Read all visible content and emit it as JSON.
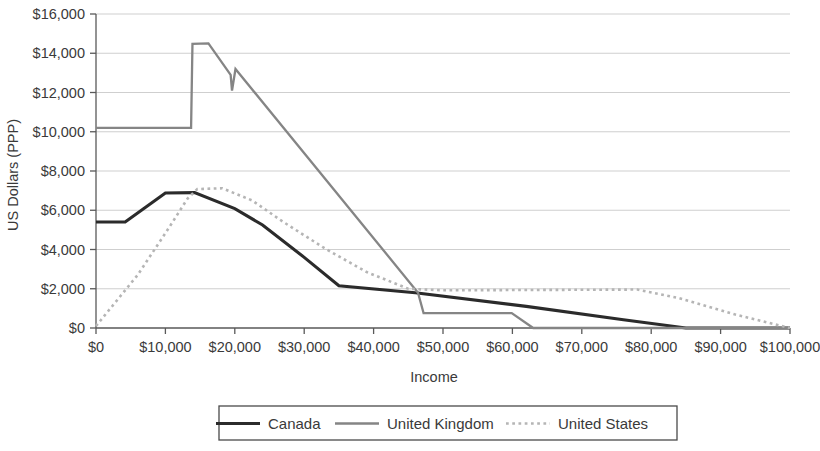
{
  "chart_data": {
    "type": "line",
    "title": "",
    "xlabel": "Income",
    "ylabel": "US Dollars (PPP)",
    "xlim": [
      0,
      100000
    ],
    "ylim": [
      0,
      16000
    ],
    "grid": true,
    "legend_position": "bottom",
    "x_tick_labels": [
      "$0",
      "$10,000",
      "$20,000",
      "$30,000",
      "$40,000",
      "$50,000",
      "$60,000",
      "$70,000",
      "$80,000",
      "$90,000",
      "$100,000"
    ],
    "x_ticks": [
      0,
      10000,
      20000,
      30000,
      40000,
      50000,
      60000,
      70000,
      80000,
      90000,
      100000
    ],
    "y_tick_labels": [
      "$0",
      "$2,000",
      "$4,000",
      "$6,000",
      "$8,000",
      "$10,000",
      "$12,000",
      "$14,000",
      "$16,000"
    ],
    "y_ticks": [
      0,
      2000,
      4000,
      6000,
      8000,
      10000,
      12000,
      14000,
      16000
    ],
    "series": [
      {
        "name": "Canada",
        "color": "#2b2b2b",
        "width": 3.1,
        "dash": "none",
        "points": [
          [
            0,
            5400
          ],
          [
            4200,
            5400
          ],
          [
            10000,
            6880
          ],
          [
            14200,
            6900
          ],
          [
            20000,
            6080
          ],
          [
            24000,
            5250
          ],
          [
            30000,
            3600
          ],
          [
            35000,
            2150
          ],
          [
            46000,
            1800
          ],
          [
            62000,
            1100
          ],
          [
            76000,
            420
          ],
          [
            85000,
            0
          ],
          [
            100000,
            0
          ]
        ]
      },
      {
        "name": "United Kingdom",
        "color": "#858585",
        "width": 2.3,
        "dash": "none",
        "points": [
          [
            0,
            10200
          ],
          [
            13700,
            10200
          ],
          [
            13900,
            14480
          ],
          [
            16200,
            14500
          ],
          [
            19400,
            12900
          ],
          [
            19600,
            12100
          ],
          [
            20100,
            13200
          ],
          [
            46400,
            1800
          ],
          [
            47200,
            760
          ],
          [
            59900,
            760
          ],
          [
            63000,
            0
          ],
          [
            100000,
            0
          ]
        ]
      },
      {
        "name": "United States",
        "color": "#b5b5b5",
        "width": 2.6,
        "dash": "dotted",
        "points": [
          [
            0,
            100
          ],
          [
            6000,
            2700
          ],
          [
            10500,
            5100
          ],
          [
            13200,
            6600
          ],
          [
            14600,
            7080
          ],
          [
            18200,
            7120
          ],
          [
            22500,
            6500
          ],
          [
            27000,
            5400
          ],
          [
            33000,
            4050
          ],
          [
            39000,
            2850
          ],
          [
            45000,
            2000
          ],
          [
            50000,
            1920
          ],
          [
            64000,
            1940
          ],
          [
            78000,
            1960
          ],
          [
            84000,
            1520
          ],
          [
            92000,
            700
          ],
          [
            100000,
            0
          ]
        ]
      }
    ]
  },
  "legend": {
    "items": [
      {
        "label": "Canada"
      },
      {
        "label": "United Kingdom"
      },
      {
        "label": "United States"
      }
    ]
  }
}
